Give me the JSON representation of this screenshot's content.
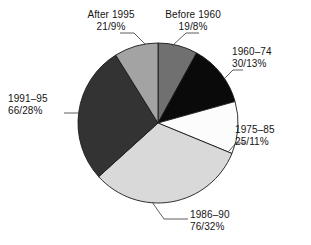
{
  "chart_data": {
    "type": "pie",
    "title": "",
    "subtitle": "",
    "xlabel": "",
    "ylabel": "",
    "legend_position": "none",
    "grid": false,
    "total_count": 237,
    "value_format": "count/percent",
    "start_angle_deg": 0,
    "direction": "clockwise",
    "categories": [
      "Before 1960",
      "1960–74",
      "1975–85",
      "1986–90",
      "1991–95",
      "After 1995"
    ],
    "values": [
      19,
      30,
      25,
      76,
      66,
      21
    ],
    "percentages": [
      8,
      13,
      11,
      32,
      28,
      9
    ],
    "colors": [
      "#707070",
      "#0a0a0a",
      "#fcfcfc",
      "#d9d9d9",
      "#333333",
      "#a3a3a3"
    ],
    "slices": [
      {
        "name": "Before 1960",
        "count": 19,
        "percent": 8,
        "label_line1": "Before 1960",
        "label_line2": "19/8%",
        "color": "#707070",
        "start_deg": 0,
        "end_deg": 28.8
      },
      {
        "name": "1960–74",
        "count": 30,
        "percent": 13,
        "label_line1": "1960–74",
        "label_line2": "30/13%",
        "color": "#0a0a0a",
        "start_deg": 28.8,
        "end_deg": 75.6
      },
      {
        "name": "1975–85",
        "count": 25,
        "percent": 11,
        "label_line1": "1975–85",
        "label_line2": "25/11%",
        "color": "#fcfcfc",
        "start_deg": 75.6,
        "end_deg": 115.2
      },
      {
        "name": "1986–90",
        "count": 76,
        "percent": 32,
        "label_line1": "1986–90",
        "label_line2": "76/32%",
        "color": "#d9d9d9",
        "start_deg": 115.2,
        "end_deg": 230.4
      },
      {
        "name": "1991–95",
        "count": 66,
        "percent": 28,
        "label_line1": "1991–95",
        "label_line2": "66/28%",
        "color": "#333333",
        "start_deg": 230.4,
        "end_deg": 331.2
      },
      {
        "name": "After 1995",
        "count": 21,
        "percent": 9,
        "label_line1": "After 1995",
        "label_line2": "21/9%",
        "color": "#a3a3a3",
        "start_deg": 331.2,
        "end_deg": 360
      }
    ]
  },
  "labels": {
    "before_1960": {
      "line1": "Before 1960",
      "line2": "19/8%"
    },
    "y1960_74": {
      "line1": "1960–74",
      "line2": "30/13%"
    },
    "y1975_85": {
      "line1": "1975–85",
      "line2": "25/11%"
    },
    "y1986_90": {
      "line1": "1986–90",
      "line2": "76/32%"
    },
    "y1991_95": {
      "line1": "1991–95",
      "line2": "66/28%"
    },
    "after_1995": {
      "line1": "After 1995",
      "line2": "21/9%"
    }
  },
  "style": {
    "slice_outline": "#1a1a1a",
    "leader_line": "#4d4d4d",
    "text_color": "#141414",
    "background": "#ffffff"
  }
}
